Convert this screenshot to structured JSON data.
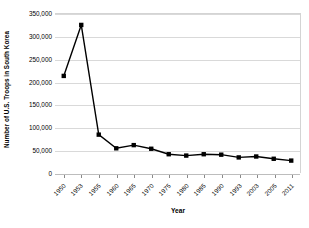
{
  "chart_data": {
    "type": "line",
    "title": "",
    "xlabel": "Year",
    "ylabel": "Number of U.S. Troops in South Korea",
    "categories": [
      "1950",
      "1953",
      "1955",
      "1960",
      "1965",
      "1970",
      "1975",
      "1980",
      "1985",
      "1990",
      "1993",
      "2003",
      "2005",
      "2011"
    ],
    "values": [
      214000,
      326000,
      85000,
      55000,
      62000,
      54000,
      42000,
      39000,
      42000,
      41000,
      35000,
      37000,
      32000,
      28000
    ],
    "ylim": [
      0,
      350000
    ],
    "ytick_labels": [
      "0",
      "50,000",
      "100,000",
      "150,000",
      "200,000",
      "250,000",
      "300,000",
      "350,000"
    ],
    "ytick_values": [
      0,
      50000,
      100000,
      150000,
      200000,
      250000,
      300000,
      350000
    ],
    "grid": true,
    "legend": false,
    "marker": "square",
    "line_color": "#000000",
    "marker_color": "#000000",
    "grid_color": "#d9d9d9"
  }
}
